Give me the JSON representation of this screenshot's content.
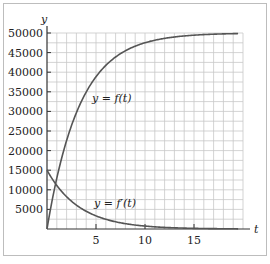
{
  "chart_data": {
    "type": "line",
    "title": "",
    "xlabel": "t",
    "ylabel": "y",
    "xlim": [
      0,
      20
    ],
    "ylim": [
      0,
      50000
    ],
    "grid": true,
    "x_ticks": [
      5,
      10,
      15
    ],
    "y_ticks": [
      5000,
      10000,
      15000,
      20000,
      25000,
      30000,
      35000,
      40000,
      45000,
      50000
    ],
    "x_tick_labels": [
      "5",
      "10",
      "15"
    ],
    "y_tick_labels": [
      "5000",
      "10000",
      "15000",
      "20000",
      "25000",
      "30000",
      "35000",
      "40000",
      "45000",
      "50000"
    ],
    "series": [
      {
        "name": "y = f(t)",
        "x": [
          0,
          1,
          2,
          3,
          4,
          5,
          6,
          7,
          8,
          10,
          12,
          15,
          20
        ],
        "values": [
          0,
          12959,
          22559,
          29672,
          34940,
          38843,
          41735,
          43877,
          45464,
          47511,
          48634,
          49445,
          49876
        ]
      },
      {
        "name": "y = f'(t)",
        "x": [
          0,
          1,
          2,
          3,
          4,
          5,
          6,
          7,
          8,
          10,
          12,
          15,
          20
        ],
        "values": [
          15000,
          11112,
          8232,
          6098,
          4518,
          3347,
          2479,
          1837,
          1361,
          747,
          410,
          167,
          37
        ]
      }
    ],
    "annotations": [
      "y = f(t)",
      "y = f'(t)"
    ],
    "legend": null
  },
  "labels": {
    "x_axis": "t",
    "y_axis": "y",
    "curve_f": "y = f(t)",
    "curve_fprime": "y = f′(t)"
  }
}
